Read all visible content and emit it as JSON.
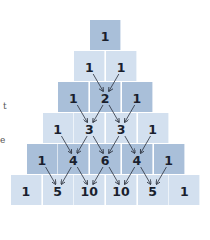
{
  "diagram": {
    "rows": [
      [
        1
      ],
      [
        1,
        1
      ],
      [
        1,
        2,
        1
      ],
      [
        1,
        3,
        3,
        1
      ],
      [
        1,
        4,
        6,
        4,
        1
      ],
      [
        1,
        5,
        10,
        10,
        5,
        1
      ]
    ],
    "colors": {
      "dark_row": "#a9bfd9",
      "light_row": "#d3e0ef",
      "text": "#1a1f2e",
      "arrow": "#2a2f3a"
    }
  },
  "edge_text": [
    "t",
    "e"
  ]
}
